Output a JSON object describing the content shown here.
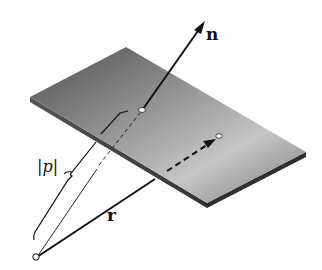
{
  "figure": {
    "labels": {
      "normal": "n",
      "position": "r",
      "distance": "|p|"
    },
    "colors": {
      "plate_light": "#d9d9d9",
      "plate_dark": "#5a5a5a",
      "plate_edge": "#3a3a3a",
      "line": "#111111",
      "background": "#ffffff"
    }
  }
}
